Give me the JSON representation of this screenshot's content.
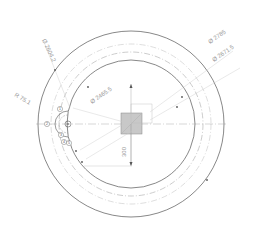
{
  "drawing": {
    "type": "technical-drawing",
    "view": "front-view-circular-flange",
    "colors": {
      "background": "#ffffff",
      "outline": "#555555",
      "centerline": "#b0b0b0",
      "dimension": "#a8a8a8",
      "hatch_fill": "#c8c8c8"
    },
    "dimensions": [
      {
        "label": "Ø 2604.2",
        "position": "upper-left"
      },
      {
        "label": "R 75.1",
        "position": "left"
      },
      {
        "label": "Ø 2465.5",
        "position": "left-center"
      },
      {
        "label": "Ø 2785",
        "position": "upper-right"
      },
      {
        "label": "Ø 2671.5",
        "position": "right"
      },
      {
        "label": "300",
        "position": "center-vertical"
      }
    ],
    "callouts": [
      {
        "label": "1"
      },
      {
        "label": "2"
      },
      {
        "label": "3"
      },
      {
        "label": "4"
      },
      {
        "label": "5"
      }
    ]
  }
}
